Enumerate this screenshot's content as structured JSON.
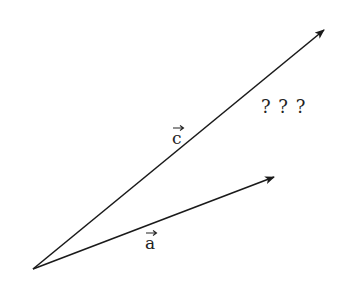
{
  "diagram": {
    "origin": {
      "x": 33,
      "y": 269
    },
    "vectors": [
      {
        "name": "c",
        "label": "c",
        "tip": {
          "x": 324,
          "y": 30
        },
        "label_pos": {
          "x": 177,
          "y": 141
        }
      },
      {
        "name": "a",
        "label": "a",
        "tip": {
          "x": 274,
          "y": 177
        },
        "label_pos": {
          "x": 150,
          "y": 246
        }
      }
    ],
    "unknown_marks": {
      "text": "? ? ?",
      "pos": {
        "x": 261,
        "y": 113
      }
    },
    "colors": {
      "stroke": "#1a1a1a",
      "text": "#222222",
      "background": "#ffffff"
    }
  }
}
